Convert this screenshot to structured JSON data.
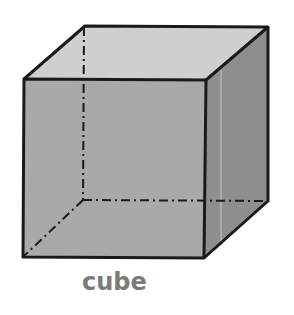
{
  "figure": {
    "label": "cube",
    "colors": {
      "front_face": "#a9a9a9",
      "top_face": "#cfcfcf",
      "side_face": "#8e8e8e",
      "edge": "#1a1a1a",
      "label": "#7a7a7a",
      "background": "#ffffff"
    },
    "edges": {
      "visible": "solid",
      "hidden": "dash-dot"
    }
  }
}
